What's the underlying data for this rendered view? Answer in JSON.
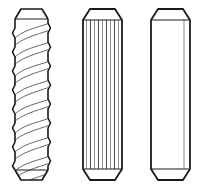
{
  "figure": {
    "background_color": "#ffffff",
    "stroke_color": "#1a1a1a",
    "inner_line_color": "#4d4d4d",
    "fill_color": "#ffffff",
    "canvas": {
      "width": 202,
      "height": 190
    },
    "caption": ""
  },
  "items": [
    {
      "id": "spiral-grooved-pin",
      "label": "Spiral grooved pin",
      "index": 1,
      "geometry": {
        "left": 15,
        "right": 48,
        "top": 9,
        "bottom": 180,
        "chamfer_height": 10,
        "chamfer_inset": 6,
        "body_top": 19,
        "body_bottom": 170
      },
      "surface": "helical-grooves",
      "groove_count": 8,
      "groove_pitch": 19,
      "edge_profile": "scalloped"
    },
    {
      "id": "straight-fluted-pin",
      "label": "Straight fluted pin",
      "index": 2,
      "geometry": {
        "left": 83,
        "right": 122,
        "top": 9,
        "bottom": 180,
        "chamfer_height": 11,
        "chamfer_inset": 7,
        "body_top": 20,
        "body_bottom": 169
      },
      "surface": "straight-flutes",
      "flute_count": 9,
      "flute_positions": [
        86,
        90,
        94,
        98,
        102,
        106,
        110,
        114,
        118
      ],
      "edge_profile": "straight"
    },
    {
      "id": "plain-dowel-pin",
      "label": "Plain dowel pin",
      "index": 3,
      "geometry": {
        "left": 151,
        "right": 190,
        "top": 9,
        "bottom": 180,
        "chamfer_height": 11,
        "chamfer_inset": 7,
        "body_top": 20,
        "body_bottom": 169
      },
      "surface": "plain",
      "facet_line_x": 184,
      "edge_profile": "straight"
    }
  ]
}
